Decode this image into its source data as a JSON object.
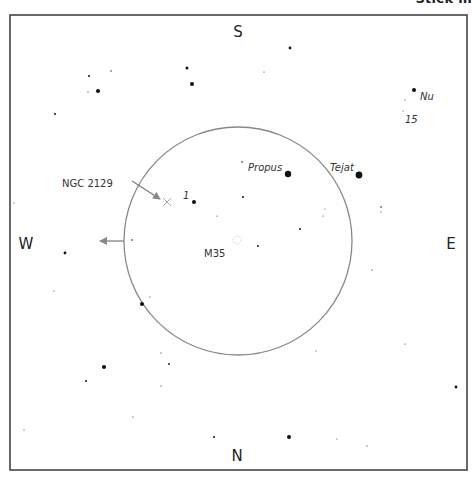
{
  "header": {
    "partial_title": "Stick m"
  },
  "frame": {
    "x": 10,
    "y": 15,
    "width": 457,
    "height": 455,
    "stroke": "#444444"
  },
  "directions": {
    "north": {
      "label": "N",
      "x": 237,
      "y": 461
    },
    "south": {
      "label": "S",
      "x": 238,
      "y": 37
    },
    "east": {
      "label": "E",
      "x": 451,
      "y": 249
    },
    "west": {
      "label": "W",
      "x": 26,
      "y": 249
    }
  },
  "field_circle": {
    "cx": 238,
    "cy": 241,
    "r": 114,
    "stroke": "#888888"
  },
  "west_arrow": {
    "x1": 124,
    "y1": 241,
    "x2": 100,
    "y2": 241,
    "color": "#999999"
  },
  "ngc_pointer": {
    "x1": 132,
    "y1": 181,
    "x2": 160,
    "y2": 199,
    "color": "#777777"
  },
  "objects": [
    {
      "name": "NGC 2129",
      "type": "open-cluster-marker",
      "x": 167,
      "y": 202,
      "label_x": 62,
      "label_y": 187,
      "style": "normal"
    },
    {
      "name": "M35",
      "type": "open-cluster",
      "x": 237,
      "y": 240,
      "label_x": 204,
      "label_y": 257,
      "style": "normal"
    }
  ],
  "star_labels": [
    {
      "text": "Propus",
      "x": 248,
      "y": 171,
      "italic": true
    },
    {
      "text": "Tejat",
      "x": 330,
      "y": 171,
      "italic": true
    },
    {
      "text": "1",
      "x": 183,
      "y": 199,
      "italic": true
    },
    {
      "text": "Nu",
      "x": 420,
      "y": 100,
      "italic": true
    },
    {
      "text": "15",
      "x": 405,
      "y": 123,
      "italic": true
    }
  ],
  "stars": [
    {
      "x": 288,
      "y": 174,
      "r": 3.2
    },
    {
      "x": 359,
      "y": 175,
      "r": 3.4
    },
    {
      "x": 194,
      "y": 202,
      "r": 2.0
    },
    {
      "x": 414,
      "y": 90,
      "r": 2.0
    },
    {
      "x": 290,
      "y": 48,
      "r": 1.4
    },
    {
      "x": 187,
      "y": 68,
      "r": 1.5
    },
    {
      "x": 192,
      "y": 84,
      "r": 2.0
    },
    {
      "x": 98,
      "y": 91,
      "r": 2.0
    },
    {
      "x": 89,
      "y": 76,
      "r": 1.0
    },
    {
      "x": 111,
      "y": 71,
      "r": 0.7
    },
    {
      "x": 88,
      "y": 92,
      "r": 0.6
    },
    {
      "x": 55,
      "y": 114,
      "r": 1.0
    },
    {
      "x": 264,
      "y": 72,
      "r": 0.6
    },
    {
      "x": 405,
      "y": 100,
      "r": 0.5
    },
    {
      "x": 403,
      "y": 111,
      "r": 0.5
    },
    {
      "x": 242,
      "y": 162,
      "r": 0.8
    },
    {
      "x": 243,
      "y": 197,
      "r": 1.0
    },
    {
      "x": 217,
      "y": 216,
      "r": 0.5
    },
    {
      "x": 300,
      "y": 229,
      "r": 1.0
    },
    {
      "x": 258,
      "y": 246,
      "r": 0.9
    },
    {
      "x": 325,
      "y": 209,
      "r": 0.5
    },
    {
      "x": 323,
      "y": 216,
      "r": 0.5
    },
    {
      "x": 381,
      "y": 207,
      "r": 0.8
    },
    {
      "x": 381,
      "y": 212,
      "r": 0.5
    },
    {
      "x": 372,
      "y": 270,
      "r": 0.6
    },
    {
      "x": 132,
      "y": 240,
      "r": 0.8
    },
    {
      "x": 65,
      "y": 253,
      "r": 1.4
    },
    {
      "x": 14,
      "y": 203,
      "r": 0.5
    },
    {
      "x": 54,
      "y": 291,
      "r": 0.5
    },
    {
      "x": 142,
      "y": 304,
      "r": 2.0
    },
    {
      "x": 150,
      "y": 297,
      "r": 0.5
    },
    {
      "x": 104,
      "y": 367,
      "r": 2.0
    },
    {
      "x": 86,
      "y": 381,
      "r": 1.0
    },
    {
      "x": 161,
      "y": 353,
      "r": 0.6
    },
    {
      "x": 169,
      "y": 364,
      "r": 0.9
    },
    {
      "x": 161,
      "y": 386,
      "r": 0.6
    },
    {
      "x": 133,
      "y": 417,
      "r": 0.6
    },
    {
      "x": 24,
      "y": 430,
      "r": 0.5
    },
    {
      "x": 214,
      "y": 437,
      "r": 1.0
    },
    {
      "x": 316,
      "y": 351,
      "r": 0.5
    },
    {
      "x": 405,
      "y": 344,
      "r": 0.6
    },
    {
      "x": 456,
      "y": 387,
      "r": 1.4
    },
    {
      "x": 289,
      "y": 437,
      "r": 2.0
    },
    {
      "x": 337,
      "y": 439,
      "r": 0.5
    },
    {
      "x": 367,
      "y": 446,
      "r": 0.6
    }
  ],
  "colors": {
    "star": "#111111",
    "text": "#222222",
    "background": "#ffffff"
  }
}
